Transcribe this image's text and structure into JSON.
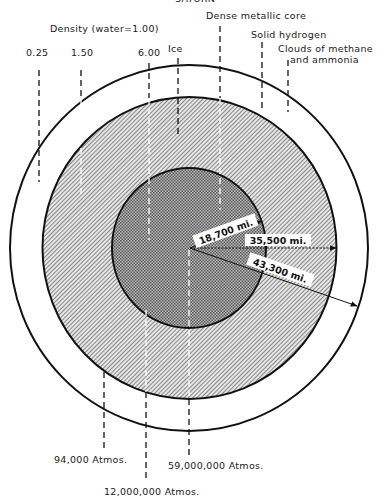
{
  "title_partial": "SATURN",
  "density_header": "Density (water=1.00)",
  "top_labels": {
    "d025": "0.25",
    "d150": "1.50",
    "d600": "6.00",
    "ice": "Ice",
    "core": "Dense metallic core",
    "solid_h": "Solid hydrogen",
    "clouds_1": "Clouds of methane",
    "clouds_2": "and ammonia"
  },
  "radii": {
    "core": "18,700 mi.",
    "mantle": "35,500 mi.",
    "outer": "43,300 mi."
  },
  "pressures": {
    "p1": "94,000 Atmos.",
    "p2": "12,000,000 Atmos.",
    "p3": "59,000,000 Atmos."
  },
  "colors": {
    "ink": "#111111",
    "background": "#ffffff",
    "mantle_hatch": "#6a6a6a",
    "core_fill": "#8c8c8c"
  }
}
